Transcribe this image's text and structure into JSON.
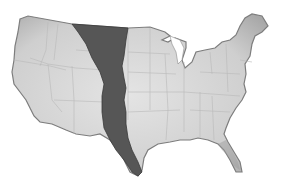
{
  "map": {
    "title": "",
    "subject": "contiguous-united-states",
    "style": "grayscale-hand-drawn",
    "colors": {
      "background": "#ffffff",
      "land": "#d6d6d6",
      "land_edge": "#8a8a8a",
      "borders": "#b8b8b8",
      "highlight_band": "#555555",
      "highlight_band_edge": "#333333"
    },
    "regions": [
      {
        "id": "highlight-band",
        "description": "dark north-south strip across the central plains from the northern border to south Texas"
      }
    ]
  }
}
